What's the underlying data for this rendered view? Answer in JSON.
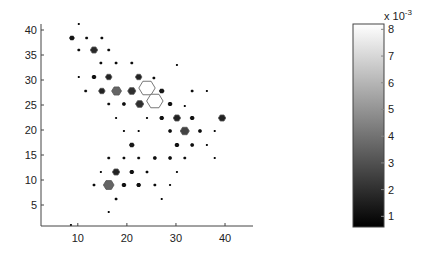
{
  "figure": {
    "background": "#ffffff",
    "axis_color": "#444444",
    "hex_outline": "#555555"
  },
  "chart_data": {
    "type": "heatmap",
    "subtype": "hexbin",
    "title": "",
    "xlabel": "",
    "ylabel": "",
    "xlim": [
      2.5,
      45.7
    ],
    "ylim": [
      0.8,
      41.2
    ],
    "xticks": [
      10,
      20,
      30,
      40
    ],
    "yticks": [
      5,
      10,
      15,
      20,
      25,
      30,
      35,
      40
    ],
    "grid": false,
    "colormap": "gray",
    "colorbar": {
      "range": [
        0.6,
        8.2
      ],
      "ticks": [
        1,
        2,
        3,
        4,
        5,
        6,
        7,
        8
      ],
      "exponent_label": "x 10",
      "exponent": "-3",
      "position": "right"
    },
    "points_note": "each hexagon: x, y in data units; size = relative hexagon radius (1 = full cell); value = color value (x 10^-3)",
    "hexagons": [
      {
        "x": 10.2,
        "y": 41.2,
        "size": 0.12,
        "value": 0.8
      },
      {
        "x": 8.8,
        "y": 38.4,
        "size": 0.35,
        "value": 1.2
      },
      {
        "x": 11.8,
        "y": 38.4,
        "size": 0.2,
        "value": 0.9
      },
      {
        "x": 14.9,
        "y": 38.4,
        "size": 0.2,
        "value": 0.9
      },
      {
        "x": 10.2,
        "y": 36.0,
        "size": 0.2,
        "value": 0.9
      },
      {
        "x": 13.3,
        "y": 36.0,
        "size": 0.45,
        "value": 1.8
      },
      {
        "x": 16.3,
        "y": 36.0,
        "size": 0.2,
        "value": 0.9
      },
      {
        "x": 14.7,
        "y": 33.4,
        "size": 0.2,
        "value": 0.9
      },
      {
        "x": 17.8,
        "y": 33.4,
        "size": 0.2,
        "value": 0.9
      },
      {
        "x": 21.0,
        "y": 33.4,
        "size": 0.2,
        "value": 0.9
      },
      {
        "x": 30.2,
        "y": 33.0,
        "size": 0.12,
        "value": 0.8
      },
      {
        "x": 10.2,
        "y": 30.6,
        "size": 0.12,
        "value": 0.8
      },
      {
        "x": 13.3,
        "y": 30.6,
        "size": 0.3,
        "value": 1.1
      },
      {
        "x": 16.3,
        "y": 30.6,
        "size": 0.4,
        "value": 1.6
      },
      {
        "x": 22.4,
        "y": 30.6,
        "size": 0.4,
        "value": 1.6
      },
      {
        "x": 25.5,
        "y": 30.4,
        "size": 0.2,
        "value": 0.9
      },
      {
        "x": 11.6,
        "y": 27.8,
        "size": 0.2,
        "value": 0.9
      },
      {
        "x": 14.9,
        "y": 27.8,
        "size": 0.4,
        "value": 1.6
      },
      {
        "x": 17.9,
        "y": 27.8,
        "size": 0.6,
        "value": 3.6
      },
      {
        "x": 21.0,
        "y": 27.8,
        "size": 0.5,
        "value": 2.0
      },
      {
        "x": 24.1,
        "y": 28.4,
        "size": 1.0,
        "value": 8.2
      },
      {
        "x": 27.1,
        "y": 27.8,
        "size": 0.35,
        "value": 1.3
      },
      {
        "x": 33.3,
        "y": 27.8,
        "size": 0.2,
        "value": 0.9
      },
      {
        "x": 36.3,
        "y": 27.8,
        "size": 0.12,
        "value": 0.8
      },
      {
        "x": 16.3,
        "y": 25.2,
        "size": 0.2,
        "value": 0.9
      },
      {
        "x": 19.4,
        "y": 25.2,
        "size": 0.25,
        "value": 1.0
      },
      {
        "x": 22.6,
        "y": 25.2,
        "size": 0.5,
        "value": 2.0
      },
      {
        "x": 25.7,
        "y": 25.8,
        "size": 1.0,
        "value": 8.2
      },
      {
        "x": 28.8,
        "y": 25.2,
        "size": 0.3,
        "value": 1.1
      },
      {
        "x": 31.8,
        "y": 24.8,
        "size": 0.12,
        "value": 0.8
      },
      {
        "x": 17.8,
        "y": 22.4,
        "size": 0.12,
        "value": 0.8
      },
      {
        "x": 24.1,
        "y": 22.4,
        "size": 0.12,
        "value": 0.8
      },
      {
        "x": 27.1,
        "y": 22.4,
        "size": 0.3,
        "value": 1.1
      },
      {
        "x": 30.2,
        "y": 22.4,
        "size": 0.45,
        "value": 1.6
      },
      {
        "x": 33.3,
        "y": 22.4,
        "size": 0.3,
        "value": 1.1
      },
      {
        "x": 39.4,
        "y": 22.4,
        "size": 0.45,
        "value": 1.6
      },
      {
        "x": 19.4,
        "y": 19.8,
        "size": 0.12,
        "value": 0.8
      },
      {
        "x": 22.4,
        "y": 19.8,
        "size": 0.12,
        "value": 0.8
      },
      {
        "x": 28.8,
        "y": 19.8,
        "size": 0.25,
        "value": 1.0
      },
      {
        "x": 31.8,
        "y": 19.8,
        "size": 0.55,
        "value": 2.6
      },
      {
        "x": 34.9,
        "y": 19.8,
        "size": 0.25,
        "value": 1.0
      },
      {
        "x": 37.9,
        "y": 19.8,
        "size": 0.12,
        "value": 0.8
      },
      {
        "x": 21.0,
        "y": 17.0,
        "size": 0.35,
        "value": 1.3
      },
      {
        "x": 30.2,
        "y": 17.0,
        "size": 0.3,
        "value": 1.1
      },
      {
        "x": 33.3,
        "y": 17.0,
        "size": 0.25,
        "value": 1.0
      },
      {
        "x": 36.3,
        "y": 17.0,
        "size": 0.12,
        "value": 0.8
      },
      {
        "x": 16.3,
        "y": 14.4,
        "size": 0.2,
        "value": 0.9
      },
      {
        "x": 19.4,
        "y": 14.4,
        "size": 0.2,
        "value": 0.9
      },
      {
        "x": 22.4,
        "y": 14.4,
        "size": 0.2,
        "value": 0.9
      },
      {
        "x": 25.7,
        "y": 14.4,
        "size": 0.25,
        "value": 1.0
      },
      {
        "x": 28.8,
        "y": 14.4,
        "size": 0.25,
        "value": 1.0
      },
      {
        "x": 31.8,
        "y": 14.4,
        "size": 0.2,
        "value": 0.9
      },
      {
        "x": 37.9,
        "y": 14.4,
        "size": 0.12,
        "value": 0.8
      },
      {
        "x": 14.7,
        "y": 11.6,
        "size": 0.12,
        "value": 0.8
      },
      {
        "x": 17.8,
        "y": 11.6,
        "size": 0.45,
        "value": 1.6
      },
      {
        "x": 21.0,
        "y": 11.6,
        "size": 0.3,
        "value": 1.1
      },
      {
        "x": 24.1,
        "y": 11.6,
        "size": 0.2,
        "value": 0.9
      },
      {
        "x": 30.2,
        "y": 11.6,
        "size": 0.12,
        "value": 0.8
      },
      {
        "x": 13.3,
        "y": 9.0,
        "size": 0.2,
        "value": 0.9
      },
      {
        "x": 16.3,
        "y": 9.0,
        "size": 0.65,
        "value": 3.6
      },
      {
        "x": 19.4,
        "y": 9.0,
        "size": 0.3,
        "value": 1.1
      },
      {
        "x": 22.4,
        "y": 9.0,
        "size": 0.3,
        "value": 1.1
      },
      {
        "x": 25.7,
        "y": 9.0,
        "size": 0.2,
        "value": 0.9
      },
      {
        "x": 28.8,
        "y": 9.0,
        "size": 0.12,
        "value": 0.8
      },
      {
        "x": 17.8,
        "y": 6.2,
        "size": 0.2,
        "value": 0.9
      },
      {
        "x": 27.1,
        "y": 6.2,
        "size": 0.12,
        "value": 0.8
      },
      {
        "x": 16.3,
        "y": 3.6,
        "size": 0.12,
        "value": 0.8
      },
      {
        "x": 8.6,
        "y": 1.0,
        "size": 0.12,
        "value": 0.8
      }
    ]
  }
}
